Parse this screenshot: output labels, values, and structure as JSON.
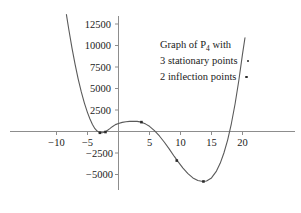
{
  "chart_data": {
    "type": "line",
    "title": "",
    "xlabel": "",
    "ylabel": "",
    "xlim": [
      -13.5,
      24
    ],
    "ylim": [
      -7200,
      13800
    ],
    "grid": false,
    "legend_position": "inside-upper-right",
    "xticks": [
      -10,
      -5,
      5,
      10,
      15,
      20
    ],
    "xtick_labels": [
      "−10",
      "−5",
      "5",
      "10",
      "15",
      "20"
    ],
    "yticks": [
      -5000,
      -2500,
      2500,
      5000,
      7500,
      10000,
      12500
    ],
    "ytick_labels": [
      "−5000",
      "−2500",
      "2500",
      "5000",
      "7500",
      "10000",
      "12500"
    ],
    "series": [
      {
        "name": "P4",
        "description": "quartic polynomial curve",
        "x": [
          -8.4,
          -8.0,
          -7.5,
          -7.0,
          -6.5,
          -6.0,
          -5.5,
          -5.0,
          -4.6,
          -4.2,
          -3.8,
          -3.4,
          -3.0,
          -2.6,
          -2.2,
          -1.8,
          -1.4,
          -1.0,
          -0.5,
          0.0,
          0.6,
          1.2,
          1.8,
          2.4,
          3.0,
          3.7,
          4.4,
          5.0,
          5.8,
          6.6,
          7.4,
          8.2,
          9.0,
          9.6,
          10.4,
          11.2,
          12.0,
          12.8,
          13.6,
          14.2,
          15.0,
          15.8,
          16.4,
          17.0,
          17.6,
          18.2,
          18.8,
          19.4,
          20.0,
          20.4
        ],
        "y": [
          13600,
          11800,
          9700,
          7800,
          6100,
          4600,
          3300,
          2200,
          1450,
          820,
          330,
          20,
          -130,
          -150,
          -60,
          110,
          330,
          560,
          800,
          940,
          1060,
          1130,
          1180,
          1200,
          1180,
          1090,
          860,
          600,
          100,
          -520,
          -1250,
          -2050,
          -2900,
          -3500,
          -4250,
          -4900,
          -5400,
          -5700,
          -5810,
          -5760,
          -5400,
          -4600,
          -3700,
          -2500,
          -1000,
          900,
          3200,
          5900,
          9000,
          10900
        ]
      }
    ],
    "marked_points": {
      "stationary_points": [
        {
          "label": "local minimum",
          "x": -3.0,
          "y": -150
        },
        {
          "label": "local maximum",
          "x": 3.7,
          "y": 1090
        },
        {
          "label": "local minimum",
          "x": 13.7,
          "y": -5810
        }
      ],
      "inflection_points": [
        {
          "label": "inflection",
          "x": -2.1,
          "y": -60
        },
        {
          "label": "inflection",
          "x": 9.4,
          "y": -3380
        }
      ]
    },
    "annotation": {
      "line1_pre": "Graph of P",
      "line1_sub": "4",
      "line1_post": " with",
      "line2": "3 stationary points",
      "line3": "2 inflection points"
    }
  }
}
